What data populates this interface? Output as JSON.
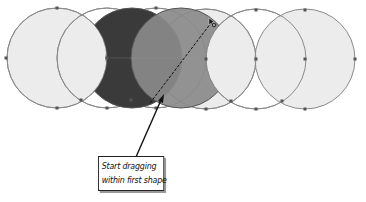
{
  "diagram": {
    "circles": [
      {
        "cx": 57,
        "cy": 58,
        "r": 50
      },
      {
        "cx": 107,
        "cy": 58,
        "r": 50
      },
      {
        "cx": 156,
        "cy": 58,
        "r": 50
      },
      {
        "cx": 206,
        "cy": 59,
        "r": 50
      },
      {
        "cx": 256,
        "cy": 59,
        "r": 50
      },
      {
        "cx": 305,
        "cy": 59,
        "r": 50
      }
    ],
    "selected_shapes": {
      "dark_crescent_fill": "#3a3a3a",
      "grey_crescent_fill": "#8a8a8a"
    },
    "colors": {
      "circle_fill": "#ececec",
      "circle_stroke": "#8a8a8a",
      "anchor": "#555555",
      "line": "#111111"
    },
    "drag_path": {
      "from": [
        150,
        102
      ],
      "to": [
        212,
        22
      ]
    },
    "callout": {
      "line1": "Start dragging",
      "line2": "within first shape"
    }
  }
}
